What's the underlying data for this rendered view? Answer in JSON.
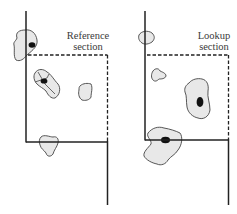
{
  "diagram": {
    "panels": [
      {
        "id": "reference",
        "label_line1": "Reference",
        "label_line2": "section"
      },
      {
        "id": "lookup",
        "label_line1": "Lookup",
        "label_line2": "section"
      }
    ],
    "colors": {
      "line": "#222222",
      "blob_fill": "#e8e8e8",
      "blob_stroke": "#444444",
      "core": "#111111"
    }
  }
}
